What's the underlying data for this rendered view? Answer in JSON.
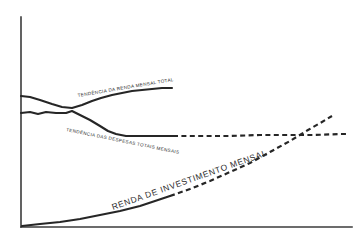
{
  "figure": {
    "background_color": "#ffffff",
    "ink_color": "#262626",
    "axis_color": "#3b3b3b",
    "style": "hand-drawn line chart, no tick labels"
  },
  "axes": {
    "y_axis_name": "vertical-axis",
    "x_axis_name": "horizontal-axis",
    "y_axis_top": 17,
    "y_axis_bottom": 227,
    "x_axis_left": 21,
    "x_axis_right": 352,
    "tick_labels": [],
    "grid": false
  },
  "labels": {
    "total_income": "TENDÊNCIA DA RENDA MENSAL TOTAL",
    "total_expenses": "TENDÊNCIA DAS DESPESAS TOTAIS MENSAIS",
    "investment_income": "RENDA DE INVESTIMENTO MENSAL"
  },
  "chart_data": {
    "type": "line",
    "title": "",
    "subtitle": "",
    "xlabel": "",
    "ylabel": "",
    "xlim": [
      0,
      100
    ],
    "ylim": [
      0,
      100
    ],
    "grid": false,
    "legend_position": "inline-curve-labels",
    "annotations": [
      {
        "name": "total-income-label",
        "text": "TENDÊNCIA DA RENDA MENSAL TOTAL",
        "x": 78,
        "y": 97,
        "rotation": -9.5,
        "size": "small"
      },
      {
        "name": "total-expenses-label",
        "text": "TENDÊNCIA DAS DESPESAS TOTAIS MENSAIS",
        "x": 66,
        "y": 131,
        "rotation": 11.5,
        "size": "small"
      },
      {
        "name": "investment-income-label",
        "text": "RENDA DE INVESTIMENTO MENSAL",
        "x": 113,
        "y": 210,
        "rotation": -19.5,
        "size": "big"
      }
    ],
    "series": [
      {
        "name": "TENDÊNCIA DA RENDA MENSAL TOTAL",
        "line_style": "solid",
        "description": "starts high at left, dips to cross the expenses curve, then rises steadily and flattens before ending mid-plot",
        "path": "M21,96 L30,97 L40,100 L52,104 L62,107 L72,108 L82,105 L92,101 L101,98 L112,95 L122,93 L132,91 L142,90 L152,89 L162,88 L172,88",
        "points": [
          {
            "x": 21,
            "y": 96
          },
          {
            "x": 40,
            "y": 100
          },
          {
            "x": 62,
            "y": 107
          },
          {
            "x": 72,
            "y": 108
          },
          {
            "x": 92,
            "y": 101
          },
          {
            "x": 112,
            "y": 95
          },
          {
            "x": 142,
            "y": 90
          },
          {
            "x": 172,
            "y": 88
          }
        ]
      },
      {
        "name": "TENDÊNCIA DAS DESPESAS TOTAIS MENSAIS",
        "line_style": "solid-then-dashed",
        "dash_starts_at_x": 173,
        "description": "starts flat at mid-left, crosses the income curve, falls to a plateau and continues as a long flat dashed line to the right edge",
        "path_solid": "M21,113 L30,112 L38,114 L46,112 L56,113 L66,113 L72,111 L80,115 L90,120 L100,126 L108,131 L116,134 L126,136 L136,136 L150,136 L162,136 L173,136",
        "path_dashed": "M173,136 L200,136 L230,136 L260,135 L290,135 L315,135 L340,134 L348,134",
        "points": [
          {
            "x": 21,
            "y": 113
          },
          {
            "x": 56,
            "y": 113
          },
          {
            "x": 72,
            "y": 111
          },
          {
            "x": 100,
            "y": 126
          },
          {
            "x": 126,
            "y": 136
          },
          {
            "x": 173,
            "y": 136
          },
          {
            "x": 260,
            "y": 135
          },
          {
            "x": 348,
            "y": 134
          }
        ]
      },
      {
        "name": "RENDA DE INVESTIMENTO MENSAL",
        "line_style": "solid-then-dashed",
        "dash_starts_at_x": 170,
        "description": "starts at the origin along the baseline, rises slowly then accelerates upward, crossing the expenses line near the right edge",
        "path_solid": "M22,226 L40,224 L60,222 L80,219 L100,215 L120,211 L140,206 L155,201 L170,196",
        "path_dashed": "M170,196 L190,189 L210,181 L230,172 L250,163 L270,152 L290,141 L308,130 L322,122 L332,116",
        "points": [
          {
            "x": 22,
            "y": 226
          },
          {
            "x": 60,
            "y": 222
          },
          {
            "x": 100,
            "y": 215
          },
          {
            "x": 140,
            "y": 206
          },
          {
            "x": 170,
            "y": 196
          },
          {
            "x": 210,
            "y": 181
          },
          {
            "x": 250,
            "y": 163
          },
          {
            "x": 290,
            "y": 141
          },
          {
            "x": 332,
            "y": 116
          }
        ]
      }
    ],
    "crossings": [
      {
        "name": "income-expenses-crossing",
        "x": 72,
        "y": 109
      },
      {
        "name": "investment-expenses-crossing",
        "x": 325,
        "y": 135
      }
    ]
  }
}
